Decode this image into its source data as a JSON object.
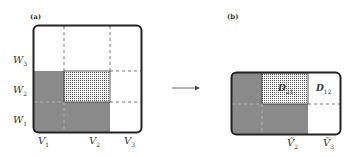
{
  "panels": {
    "a": {
      "label": "(a)"
    },
    "b": {
      "label": "(b)"
    }
  },
  "panel_a": {
    "row_labels": [
      {
        "base": "W",
        "sub": "3"
      },
      {
        "base": "W",
        "sub": "2"
      },
      {
        "base": "W",
        "sub": "1"
      }
    ],
    "col_labels": [
      {
        "base": "V",
        "sub": "1"
      },
      {
        "base": "V",
        "sub": "2"
      },
      {
        "base": "V",
        "sub": "3"
      }
    ]
  },
  "panel_b": {
    "blocks": [
      {
        "base": "D",
        "sub": "21"
      },
      {
        "base": "D",
        "sub": "12"
      }
    ],
    "col_labels": [
      {
        "base": "Ṽ",
        "sub": "2"
      },
      {
        "base": "Ṽ",
        "sub": "3"
      }
    ]
  },
  "arrow": {
    "direction": "right"
  },
  "colors": {
    "gray_fill": "#8a8a8a",
    "dotted_fill": "#d4d4d4",
    "border": "#222222",
    "dash": "#555555"
  }
}
